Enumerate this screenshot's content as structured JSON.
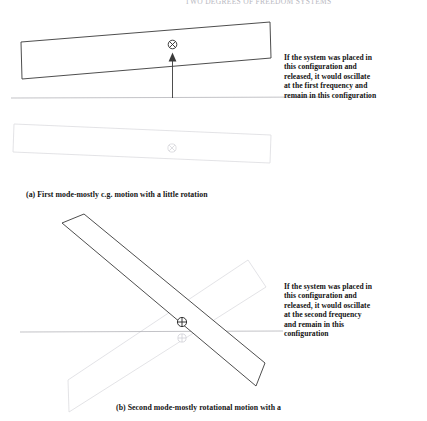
{
  "figure": {
    "cutoff_header_text": "TWO DEGREES OF FREEDOM SYSTEMS",
    "panels": [
      {
        "id": "panel-a",
        "caption": "(a) First mode-mostly c.g. motion with a little rotation",
        "note_lines": [
          "If the system was placed in",
          "this configuration and",
          "released, it would oscillate",
          "at the first frequency and",
          "remain in this configuration"
        ],
        "cg_symbol": "circle-cross-x",
        "cg_symbol_glyph": "⊗",
        "arrow_direction": "up",
        "reference_line_label": "static-equilibrium-line",
        "deflected_body_label": "deflected-beam",
        "ghost_body_label": "undeflected-beam-ghost"
      },
      {
        "id": "panel-b",
        "caption": "(b) Second mode-mostly rotational motion with a",
        "note_lines": [
          "If the system was placed in",
          "this configuration and",
          "released, it would oscillate",
          "at the second frequency",
          "and remain in this",
          "configuration"
        ],
        "cg_symbol": "circle-plus",
        "cg_symbol_glyph": "⊕",
        "reference_line_label": "static-equilibrium-line",
        "deflected_body_label": "rotated-beam",
        "ghost_body_label": "rotated-beam-ghost"
      }
    ],
    "colors": {
      "ink": "#333333",
      "ghost": "#d8d8dc",
      "rule": "#a8a8ae",
      "text": "#121212"
    }
  }
}
